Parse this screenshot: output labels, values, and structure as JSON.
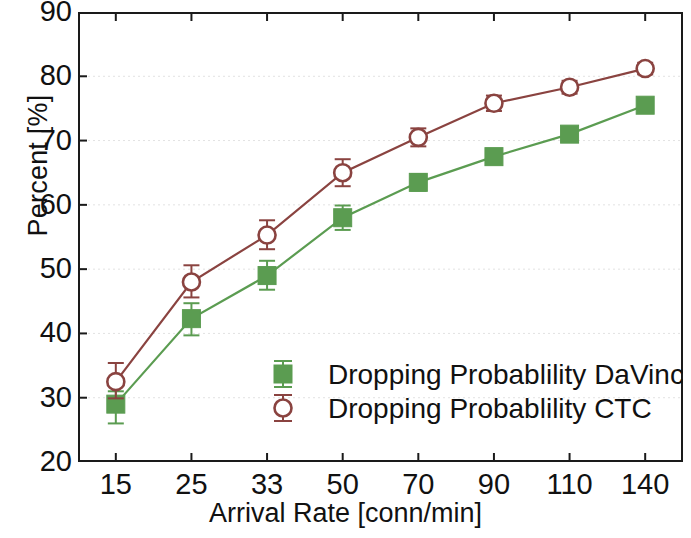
{
  "chart_data": {
    "type": "line",
    "title": "",
    "xlabel": "Arrival Rate [conn/min]",
    "ylabel": "Percent [%]",
    "categories": [
      "15",
      "25",
      "33",
      "50",
      "70",
      "90",
      "110",
      "140"
    ],
    "ylim": [
      20,
      90
    ],
    "yticks": [
      "20",
      "30",
      "40",
      "50",
      "60",
      "70",
      "80",
      "90"
    ],
    "grid": true,
    "legend_position": "bottom-right inside axes",
    "series": [
      {
        "name": "Dropping Probablility DaVinci",
        "color": "#5b9c51",
        "marker": "filled-square",
        "values": [
          29.0,
          42.3,
          49.0,
          58.0,
          63.5,
          67.5,
          71.0,
          75.5
        ],
        "err_low": [
          3.0,
          2.6,
          2.2,
          1.9,
          1.3,
          1.2,
          1.0,
          1.1
        ],
        "err_high": [
          2.0,
          2.4,
          2.3,
          1.9,
          1.3,
          1.2,
          1.0,
          1.1
        ]
      },
      {
        "name": "Dropping Probablility CTC",
        "color": "#8a4340",
        "marker": "open-circle",
        "values": [
          32.5,
          48.0,
          55.3,
          65.0,
          70.5,
          75.8,
          78.3,
          81.2
        ],
        "err_low": [
          2.6,
          2.4,
          2.2,
          2.1,
          1.4,
          1.2,
          1.0,
          0.9
        ],
        "err_high": [
          2.9,
          2.6,
          2.3,
          2.1,
          1.4,
          1.2,
          1.0,
          0.9
        ]
      }
    ]
  },
  "legend": {
    "items": [
      {
        "label": "Dropping Probablility DaVinci",
        "marker": "filled-square",
        "color": "#5b9c51"
      },
      {
        "label": "Dropping Probablility CTC",
        "marker": "open-circle",
        "color": "#8a4340"
      }
    ]
  },
  "style": {
    "axis_color": "#1a1a1a",
    "grid_color": "#e2e2e2",
    "background": "#ffffff"
  }
}
